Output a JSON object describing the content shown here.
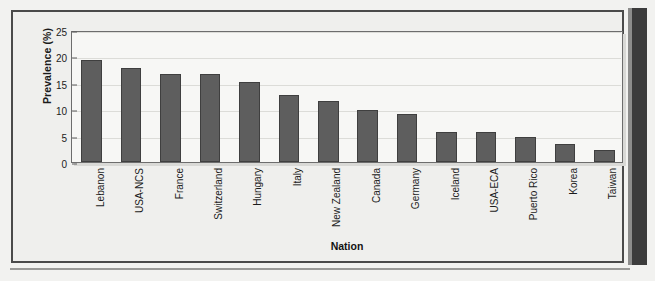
{
  "figure": {
    "x_axis_title": "Nation",
    "y_axis_title": "Prevalence (%)"
  },
  "chart_data": {
    "type": "bar",
    "title": "",
    "subtitle": "",
    "xlabel": "Nation",
    "ylabel": "Prevalence (%)",
    "categories": [
      "Lebanon",
      "USA-NCS",
      "France",
      "Switzerland",
      "Hungary",
      "Italy",
      "New Zealand",
      "Canada",
      "Germany",
      "Iceland",
      "USA-ECA",
      "Puerto Rico",
      "Korea",
      "Taiwan"
    ],
    "values": [
      19.3,
      17.8,
      16.6,
      16.6,
      15.1,
      12.6,
      11.6,
      9.8,
      9.0,
      5.6,
      5.6,
      4.8,
      3.4,
      2.2
    ],
    "ylim": [
      0,
      25
    ],
    "yticks": [
      0,
      5,
      10,
      15,
      20,
      25
    ],
    "ytick_labels": [
      "0",
      "5",
      "10",
      "15",
      "20",
      "25"
    ],
    "grid": true,
    "legend": "none",
    "bar_color": "#5e5e5e",
    "bar_edge_color": "#3f3f3f",
    "plot_background": "#f7f7f5",
    "figure_background": "#efefed",
    "frame_color": "#4a4a4a"
  }
}
